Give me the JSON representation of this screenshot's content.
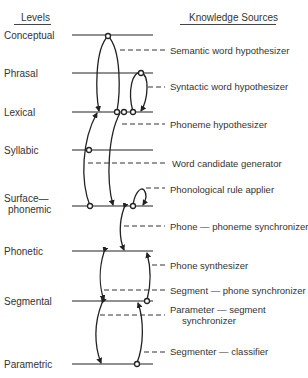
{
  "headers": {
    "levels": "Levels",
    "knowledge_sources": "Knowledge Sources"
  },
  "levels": [
    {
      "label": "Conceptual",
      "y": 35
    },
    {
      "label": "Phrasal",
      "y": 73
    },
    {
      "label": "Lexical",
      "y": 112
    },
    {
      "label": "Syllabic",
      "y": 150
    },
    {
      "label": "Surface—",
      "label2": "phonemic",
      "y": 206
    },
    {
      "label": "Phonetic",
      "y": 251
    },
    {
      "label": "Segmental",
      "y": 301
    },
    {
      "label": "Parametric",
      "y": 364
    }
  ],
  "knowledge_sources": [
    {
      "label": "Semantic word hypothesizer",
      "y": 50
    },
    {
      "label": "Syntactic word hypothesizer",
      "y": 87
    },
    {
      "label": "Phoneme hypothesizer",
      "y": 124
    },
    {
      "label": "Word candidate generator",
      "y": 163
    },
    {
      "label": "Phonological rule applier",
      "y": 189
    },
    {
      "label": "Phone — phoneme synchronizer",
      "y": 226
    },
    {
      "label": "Phone synthesizer",
      "y": 265
    },
    {
      "label": "Segment — phone synchronizer",
      "y": 290
    },
    {
      "label": "Parameter — segment",
      "label2": "synchronizer",
      "y": 310
    },
    {
      "label": "Segmenter — classifier",
      "y": 351
    }
  ]
}
